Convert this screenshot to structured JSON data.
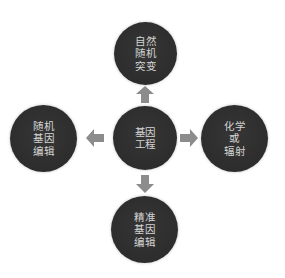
{
  "diagram": {
    "colors": {
      "node_fill": "#2f2f2f",
      "node_text": "#d4d4d4",
      "arrow": "#8c8c8c",
      "background": "#ffffff"
    },
    "center": {
      "label": "基因\n工程"
    },
    "top": {
      "label": "自然\n随机\n突变"
    },
    "left": {
      "label": "随机\n基因\n编辑"
    },
    "right": {
      "label": "化学\n或\n辐射"
    },
    "bottom": {
      "label": "精准\n基因\n编辑"
    },
    "arrows": [
      {
        "direction": "up",
        "icon": "arrow-up-icon"
      },
      {
        "direction": "left",
        "icon": "arrow-left-icon"
      },
      {
        "direction": "right",
        "icon": "arrow-right-icon"
      },
      {
        "direction": "down",
        "icon": "arrow-down-icon"
      }
    ]
  }
}
